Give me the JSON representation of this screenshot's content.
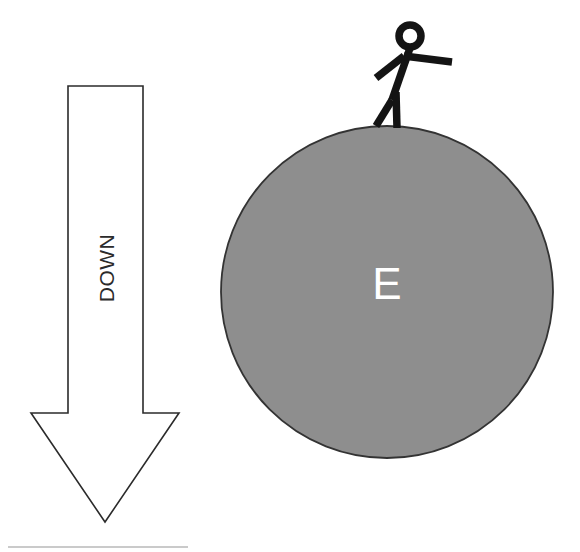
{
  "diagram": {
    "background_color": "#ffffff",
    "width": 580,
    "height": 552
  },
  "arrow": {
    "name": "down-arrow",
    "label": "DOWN",
    "direction": "down",
    "rotation_deg": -90,
    "fill_color": "#ffffff",
    "stroke_color": "#2b2b2b",
    "geometry": {
      "shaft_left_x": 68,
      "shaft_right_x": 143,
      "shaft_top_y": 86,
      "barb_y": 413,
      "barb_left_x": 31,
      "barb_right_x": 179,
      "tip_x": 105,
      "tip_y": 522
    }
  },
  "planet": {
    "name": "earth-circle",
    "label": "E",
    "label_color": "#ffffff",
    "fill_color": "#8e8e8e",
    "stroke_color": "#333333",
    "center_x": 387,
    "center_y": 292,
    "radius": 166
  },
  "person": {
    "name": "stick-figure",
    "stroke_color": "#141414",
    "stroke_width": 7.5,
    "head": {
      "cx": 410,
      "cy": 36,
      "r": 11
    },
    "torso": {
      "x1": 410,
      "y1": 48,
      "x2": 392,
      "y2": 100
    },
    "arm_right": {
      "x1": 404,
      "y1": 56,
      "x2": 452,
      "y2": 62
    },
    "arm_left": {
      "x1": 404,
      "y1": 56,
      "x2": 376,
      "y2": 78
    },
    "leg_left": {
      "x1": 392,
      "y1": 100,
      "x2": 376,
      "y2": 126
    },
    "leg_right": {
      "x1": 396,
      "y1": 92,
      "x2": 397,
      "y2": 128
    }
  }
}
